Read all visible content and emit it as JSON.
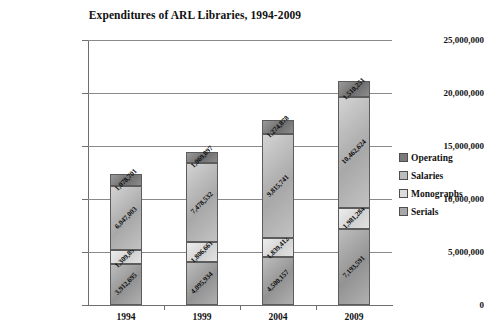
{
  "chart_data": {
    "type": "bar",
    "subtype": "stacked-bar",
    "title": "Expenditures of ARL Libraries, 1994-2009",
    "xlabel": "",
    "ylabel": "",
    "categories": [
      "1994",
      "1999",
      "2004",
      "2009"
    ],
    "ylim": [
      0,
      25000000
    ],
    "ytick_values": [
      0,
      5000000,
      10000000,
      15000000,
      20000000,
      25000000
    ],
    "ytick_labels": [
      "0",
      "5,000,000",
      "10,000,000",
      "15,000,000",
      "20,000,000",
      "25,000,000"
    ],
    "grid": true,
    "legend_position": "right",
    "stack_order_bottom_to_top": [
      "Serials",
      "Monographs",
      "Salaries",
      "Operating"
    ],
    "series": [
      {
        "name": "Serials",
        "color": "#a8a8a8",
        "values": [
          3912695,
          4095934,
          4500157,
          7193591
        ],
        "labels": [
          "3,912,695",
          "4,095,934",
          "4,500,157",
          "7,193,591"
        ]
      },
      {
        "name": "Monographs",
        "color": "#dcdcdc",
        "values": [
          1309897,
          1806661,
          1839412,
          1981284
        ],
        "labels": [
          "1,309,897",
          "1,806,661",
          "1,839,412",
          "1,981,284"
        ]
      },
      {
        "name": "Salaries",
        "color": "#bdbdbd",
        "values": [
          6047003,
          7478532,
          9815741,
          10462624
        ],
        "labels": [
          "6,047,003",
          "7,478,532",
          "9,815,741",
          "10,462,624"
        ]
      },
      {
        "name": "Operating",
        "color": "#7a7a7a",
        "values": [
          1078701,
          1069897,
          1274878,
          1510251
        ],
        "labels": [
          "1,078,701",
          "1,069,897",
          "1,274,878",
          "1,510,251"
        ]
      }
    ],
    "legend_entries": [
      {
        "label": "Operating",
        "color": "#7a7a7a"
      },
      {
        "label": "Salaries",
        "color": "#bdbdbd"
      },
      {
        "label": "Monographs",
        "color": "#dcdcdc"
      },
      {
        "label": "Serials",
        "color": "#a8a8a8"
      }
    ]
  }
}
